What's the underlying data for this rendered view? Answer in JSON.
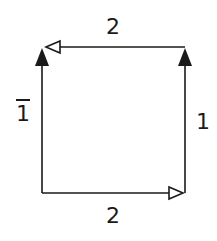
{
  "diagram": {
    "type": "square-cycle",
    "edges": [
      {
        "id": "top",
        "label": "2",
        "direction": "right-to-left",
        "arrowhead": "open"
      },
      {
        "id": "bottom",
        "label": "2",
        "direction": "left-to-right",
        "arrowhead": "open"
      },
      {
        "id": "left",
        "label": "1",
        "label_overbar": true,
        "direction": "bottom-to-top",
        "arrowhead": "filled"
      },
      {
        "id": "right",
        "label": "1",
        "label_overbar": false,
        "direction": "bottom-to-top",
        "arrowhead": "filled"
      }
    ],
    "colors": {
      "stroke": "#1a1a1a",
      "background": "#ffffff"
    }
  }
}
